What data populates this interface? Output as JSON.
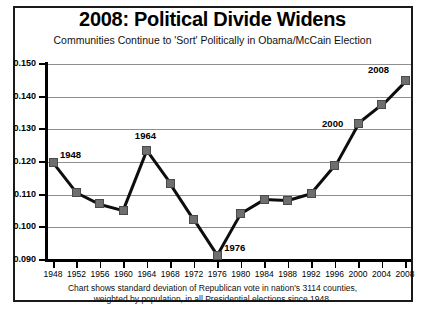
{
  "header": {
    "title": "2008: Political Divide Widens",
    "subtitle": "Communities Continue to 'Sort' Politically in Obama/McCain Election"
  },
  "footnote": {
    "line1": "Chart shows standard deviation of Republican vote in nation's 3114 counties,",
    "line2": "weighted by population, in all Presidential elections  since 1948."
  },
  "colors": {
    "marker": "#6e6e6e",
    "line": "#0d0d0d",
    "grid": "#8e8e8e",
    "axis": "#000000",
    "frame": "#1a1a1a"
  },
  "chart_data": {
    "type": "line",
    "title": "2008: Political Divide Widens",
    "subtitle": "Communities Continue to 'Sort' Politically in Obama/McCain Election",
    "xlabel": "",
    "ylabel": "Weighted Standard Deviation",
    "categories": [
      1948,
      1952,
      1956,
      1960,
      1964,
      1968,
      1972,
      1976,
      1980,
      1984,
      1988,
      1992,
      1996,
      2000,
      2004,
      2008
    ],
    "values": [
      0.12,
      0.1108,
      0.1072,
      0.1053,
      0.1235,
      0.1135,
      0.1025,
      0.0915,
      0.1042,
      0.1085,
      0.1082,
      0.1103,
      0.1188,
      0.1318,
      0.1375,
      0.1448
    ],
    "ylim": [
      0.09,
      0.15
    ],
    "yticks": [
      "0.090",
      "0.100",
      "0.110",
      "0.120",
      "0.130",
      "0.140",
      "0.150"
    ],
    "ytick_values": [
      0.09,
      0.1,
      0.11,
      0.12,
      0.13,
      0.14,
      0.15
    ],
    "xtick_labels": [
      "1948",
      "1952",
      "1956",
      "1960",
      "1964",
      "1968",
      "1972",
      "1976",
      "1980",
      "1984",
      "1988",
      "1992",
      "1996",
      "2000",
      "2004",
      "2008"
    ],
    "grid": true,
    "legend": "none",
    "marker": "square",
    "annotations": [
      {
        "label": "1948",
        "x": 1948,
        "y": 0.12,
        "position": "right"
      },
      {
        "label": "1964",
        "x": 1964,
        "y": 0.1235,
        "position": "above"
      },
      {
        "label": "1976",
        "x": 1976,
        "y": 0.0915,
        "position": "right"
      },
      {
        "label": "2000",
        "x": 2000,
        "y": 0.1318,
        "position": "left"
      },
      {
        "label": "2008",
        "x": 2008,
        "y": 0.1448,
        "position": "above-left"
      }
    ]
  }
}
